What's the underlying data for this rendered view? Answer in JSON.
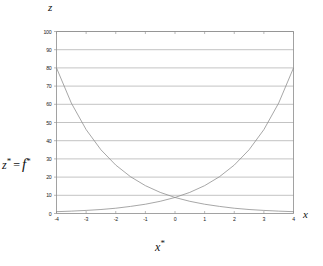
{
  "figure": {
    "top_axis_label": "z",
    "right_axis_label": "x",
    "xaxis_title_main": "x",
    "xaxis_title_star": "*",
    "yaxis_title_z": "z",
    "yaxis_title_star1": "*",
    "yaxis_title_eq": "=",
    "yaxis_title_f": "f",
    "yaxis_title_star2": "*"
  },
  "style": {
    "axis_color": "#8a8a8a",
    "grid_color": "#9a9a9a",
    "curve_color": "#8a8a8a",
    "background": "#ffffff",
    "text_color": "#1a1a1a"
  },
  "chart_data": {
    "type": "line",
    "title": "",
    "subtitle": "",
    "xlabel": "x*",
    "ylabel": "z* = f*",
    "xlim": [
      -4,
      4
    ],
    "ylim": [
      0,
      100
    ],
    "xticks": [
      -4,
      -3,
      -2,
      -1,
      0,
      1,
      2,
      3,
      4
    ],
    "xtick_labels": [
      "-4",
      "-3",
      "-2",
      "-1",
      "0",
      "1",
      "2",
      "3",
      "4"
    ],
    "yticks": [
      0,
      10,
      20,
      30,
      40,
      50,
      60,
      70,
      80,
      90,
      100
    ],
    "ytick_labels": [
      "0",
      "10",
      "20",
      "30",
      "40",
      "50",
      "60",
      "70",
      "80",
      "90",
      "100"
    ],
    "grid": "horizontal",
    "legend": "none",
    "annotations": [
      "z",
      "x",
      "x*",
      "z* = f*"
    ],
    "x": [
      -4,
      -3.5,
      -3,
      -2.5,
      -2,
      -1.5,
      -1,
      -0.5,
      0,
      0.5,
      1,
      1.5,
      2,
      2.5,
      3,
      3.5,
      4
    ],
    "series": [
      {
        "name": "decreasing-exponential",
        "values": [
          80,
          60.7,
          46.1,
          35.0,
          26.6,
          20.2,
          15.3,
          11.6,
          8.8,
          6.7,
          5.1,
          3.9,
          2.9,
          2.2,
          1.7,
          1.3,
          1.0
        ]
      },
      {
        "name": "increasing-exponential",
        "values": [
          1.0,
          1.3,
          1.7,
          2.2,
          2.9,
          3.9,
          5.1,
          6.7,
          8.8,
          11.6,
          15.3,
          20.2,
          26.6,
          35.0,
          46.1,
          60.7,
          80
        ]
      }
    ]
  }
}
